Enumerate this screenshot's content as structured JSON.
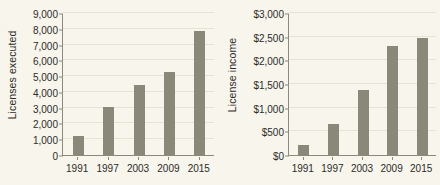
{
  "chart_data": [
    {
      "type": "bar",
      "title": "",
      "xlabel": "",
      "ylabel": "Licenses executed",
      "categories": [
        "1991",
        "1997",
        "2003",
        "2009",
        "2015"
      ],
      "values": [
        1200,
        3050,
        4450,
        5250,
        7850
      ],
      "ylim": [
        0,
        9000
      ],
      "yticks": [
        0,
        1000,
        2000,
        3000,
        4000,
        5000,
        6000,
        7000,
        8000,
        9000
      ],
      "ytick_labels": [
        "0",
        "1,000",
        "2,000",
        "3,000",
        "4,000",
        "5,000",
        "6,000",
        "7,000",
        "8,000",
        "9,000"
      ],
      "grid": true,
      "legend": "none",
      "bar_color": "#8a8878",
      "background_color": "#f7f5ec",
      "axis_color": "#8b8a7c"
    },
    {
      "type": "bar",
      "title": "",
      "xlabel": "",
      "ylabel": "License income",
      "categories": [
        "1991",
        "1997",
        "2003",
        "2009",
        "2015"
      ],
      "values": [
        210,
        660,
        1370,
        2300,
        2480
      ],
      "ylim": [
        0,
        3000
      ],
      "yticks": [
        0,
        500,
        1000,
        1500,
        2000,
        2500,
        3000
      ],
      "ytick_labels": [
        "$0",
        "$500",
        "$1,000",
        "$1,500",
        "$2,000",
        "$2,500",
        "$3,000"
      ],
      "grid": true,
      "legend": "none",
      "bar_color": "#8a8878",
      "background_color": "#f7f5ec",
      "axis_color": "#8b8a7c"
    }
  ]
}
